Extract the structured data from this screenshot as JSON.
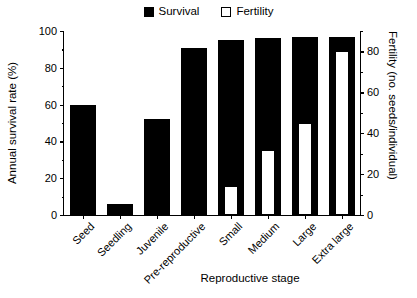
{
  "legend": {
    "entries": [
      {
        "label": "Survival",
        "swatch": "filled-square-icon",
        "color": "#000000"
      },
      {
        "label": "Fertility",
        "swatch": "open-square-icon",
        "color": "#ffffff"
      }
    ]
  },
  "axes": {
    "left": {
      "title": "Annual survival rate (%)",
      "ticks": [
        0,
        20,
        40,
        60,
        80,
        100
      ],
      "minor_ticks": [
        10,
        30,
        50,
        70,
        90
      ],
      "min": 0,
      "max": 100
    },
    "right": {
      "title": "Fertility (no. seeds/individual)",
      "ticks": [
        0,
        20,
        40,
        60,
        80
      ],
      "minor_ticks": [
        10,
        30,
        50,
        70,
        90
      ],
      "min": 0,
      "max": 90
    },
    "bottom": {
      "title": "Reproductive stage"
    }
  },
  "chart_data": {
    "type": "bar",
    "title": "",
    "xlabel": "Reproductive stage",
    "ylabel": "Annual survival rate (%)",
    "y2label": "Fertility (no. seeds/individual)",
    "ylim": [
      0,
      100
    ],
    "y2lim": [
      0,
      90
    ],
    "grid": false,
    "legend_position": "top-center",
    "categories": [
      "Seed",
      "Seedling",
      "Juvenile",
      "Pre-reproductive",
      "Small",
      "Medium",
      "Large",
      "Extra large"
    ],
    "series": [
      {
        "name": "Survival",
        "axis": "left",
        "unit": "%",
        "color": "#000000",
        "values": [
          60,
          6,
          52,
          91,
          95,
          96,
          97,
          97
        ]
      },
      {
        "name": "Fertility",
        "axis": "right",
        "unit": "no. seeds/individual",
        "color": "#ffffff",
        "values": [
          null,
          null,
          null,
          null,
          14,
          32,
          45,
          80
        ]
      }
    ]
  }
}
